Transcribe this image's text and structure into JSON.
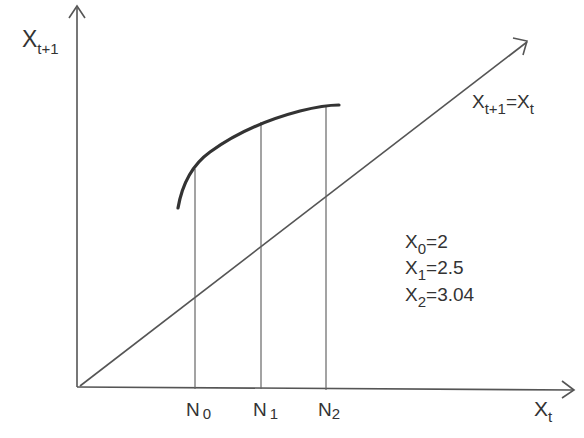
{
  "diagram": {
    "type": "cobweb-map",
    "axes": {
      "y_label": {
        "main": "X",
        "sub": "t+1"
      },
      "x_label": {
        "main": "X",
        "sub": "t"
      }
    },
    "identity_line": {
      "label": {
        "main1": "X",
        "sub1": "t+1",
        "eq": "=",
        "main2": "X",
        "sub2": "t"
      }
    },
    "ticks": [
      {
        "main": "N",
        "sub": "0"
      },
      {
        "main": "N",
        "sub": "1"
      },
      {
        "main": "N",
        "sub": "2"
      }
    ],
    "values": [
      {
        "main": "X",
        "sub": "0",
        "rest": "=2"
      },
      {
        "main": "X",
        "sub": "1",
        "rest": "=2.5"
      },
      {
        "main": "X",
        "sub": "2",
        "rest": "=3.04"
      }
    ],
    "colors": {
      "stroke": "#444444",
      "curve": "#333333",
      "text": "#333333"
    }
  }
}
